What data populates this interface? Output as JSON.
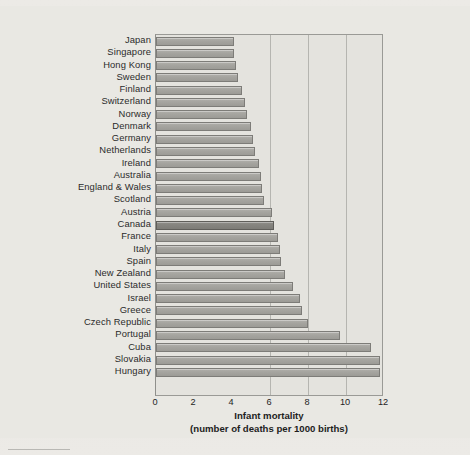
{
  "chart_data": {
    "type": "bar",
    "orientation": "horizontal",
    "title": "",
    "xlabel": "Infant mortality\n(number of deaths per 1000 births)",
    "xlabel_line1": "Infant mortality",
    "xlabel_line2": "(number of deaths per 1000 births)",
    "ylabel": "",
    "xlim": [
      0,
      12
    ],
    "xticks": [
      0,
      2,
      4,
      6,
      8,
      10,
      12
    ],
    "xtick_labels": [
      "0",
      "2",
      "4",
      "6",
      "8",
      "10",
      "12"
    ],
    "gridlines": [
      6,
      8,
      10
    ],
    "grid": true,
    "legend": null,
    "highlight_category": "Canada",
    "bar_color": "#a5a49f",
    "highlight_color": "#85847f",
    "categories": [
      "Japan",
      "Singapore",
      "Hong Kong",
      "Sweden",
      "Finland",
      "Switzerland",
      "Norway",
      "Denmark",
      "Germany",
      "Netherlands",
      "Ireland",
      "Australia",
      "England & Wales",
      "Scotland",
      "Austria",
      "Canada",
      "France",
      "Italy",
      "Spain",
      "New Zealand",
      "United States",
      "Israel",
      "Greece",
      "Czech Republic",
      "Portugal",
      "Cuba",
      "Slovakia",
      "Hungary"
    ],
    "values": [
      4.1,
      4.1,
      4.2,
      4.3,
      4.5,
      4.7,
      4.8,
      5.0,
      5.1,
      5.2,
      5.4,
      5.5,
      5.6,
      5.7,
      6.1,
      6.2,
      6.4,
      6.5,
      6.6,
      6.8,
      7.2,
      7.6,
      7.7,
      8.0,
      9.7,
      11.3,
      11.8,
      11.8
    ]
  },
  "footer": {
    "rule": ""
  }
}
